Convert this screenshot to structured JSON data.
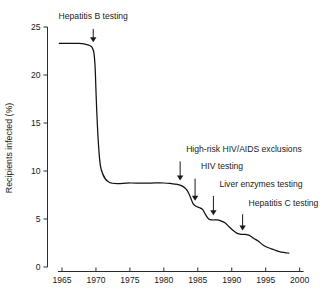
{
  "chart_data": {
    "type": "line",
    "title": "",
    "xlabel": "",
    "ylabel": "Recipients infected (%)",
    "xlim": [
      1963.5,
      2000.5
    ],
    "ylim": [
      0,
      25
    ],
    "grid": false,
    "legend": "none",
    "x_ticks": [
      1965,
      1970,
      1975,
      1980,
      1985,
      1990,
      1995,
      2000
    ],
    "x_tick_labels": [
      "1965",
      "1970",
      "1975",
      "1980",
      "1985",
      "1990",
      "1995",
      "2000"
    ],
    "y_ticks": [
      0,
      5,
      10,
      15,
      20,
      25
    ],
    "y_tick_labels": [
      "0",
      "5",
      "10",
      "15",
      "20",
      "25"
    ],
    "series": [
      {
        "name": "Recipients infected",
        "color": "#111111",
        "x": [
          1964.6,
          1966.0,
          1967.5,
          1968.5,
          1969.0,
          1969.4,
          1969.7,
          1969.9,
          1970.1,
          1970.4,
          1970.8,
          1972.0,
          1975.0,
          1978.0,
          1980.0,
          1981.0,
          1982.0,
          1982.8,
          1983.4,
          1983.9,
          1984.3,
          1984.8,
          1985.2,
          1985.7,
          1986.1,
          1986.6,
          1987.2,
          1987.8,
          1988.4,
          1989.0,
          1989.6,
          1990.2,
          1990.8,
          1991.4,
          1992.0,
          1992.6,
          1993.2,
          1993.9,
          1994.6,
          1995.4,
          1996.2,
          1997.0,
          1997.8,
          1998.4
        ],
        "y": [
          23.3,
          23.3,
          23.3,
          23.2,
          23.1,
          22.9,
          22.3,
          20.5,
          16.5,
          12.5,
          10.1,
          8.8,
          8.75,
          8.75,
          8.75,
          8.7,
          8.6,
          8.4,
          8.0,
          7.3,
          6.6,
          6.3,
          6.2,
          6.0,
          5.5,
          5.0,
          4.9,
          4.9,
          4.8,
          4.6,
          4.2,
          3.8,
          3.5,
          3.4,
          3.4,
          3.3,
          3.0,
          2.7,
          2.3,
          2.0,
          1.8,
          1.6,
          1.5,
          1.45
        ]
      }
    ],
    "annotations": [
      {
        "label": "Hepatitis B testing",
        "x": 1969.6,
        "text_anchor_x": 1969.6,
        "text_y_value": 25.8,
        "arrow_top_value": 24.8,
        "arrow_tip_value": 23.4,
        "label_align": "middle"
      },
      {
        "label": "High-risk HIV/AIDS exclusions",
        "x": 1982.4,
        "text_anchor_x": 1982.4,
        "text_y_value": 12.0,
        "arrow_top_value": 11.0,
        "arrow_tip_value": 9.0,
        "label_align": "start"
      },
      {
        "label": "HIV testing",
        "x": 1984.6,
        "text_anchor_x": 1984.6,
        "text_y_value": 10.2,
        "arrow_top_value": 9.2,
        "arrow_tip_value": 6.9,
        "label_align": "start"
      },
      {
        "label": "Liver enzymes testing",
        "x": 1987.3,
        "text_anchor_x": 1987.3,
        "text_y_value": 8.3,
        "arrow_top_value": 7.4,
        "arrow_tip_value": 5.4,
        "label_align": "start"
      },
      {
        "label": "Hepatitis C testing",
        "x": 1991.6,
        "text_anchor_x": 1991.6,
        "text_y_value": 6.4,
        "arrow_top_value": 5.5,
        "arrow_tip_value": 3.8,
        "label_align": "start"
      }
    ]
  }
}
